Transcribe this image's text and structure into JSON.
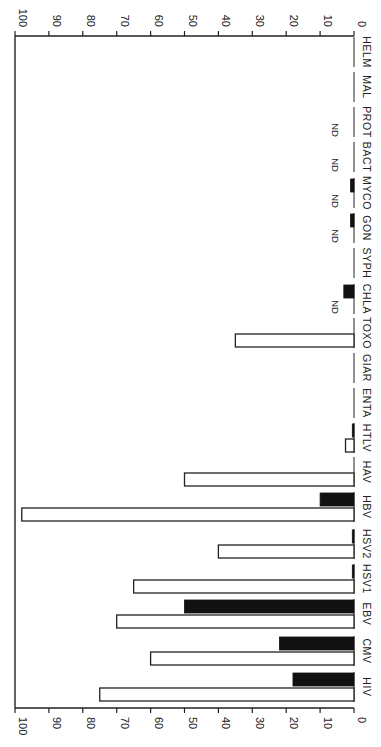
{
  "chart_data": {
    "type": "bar",
    "orientation": "rotated-90-clockwise (horizontal bars on page; page must be rotated to read)",
    "title": "",
    "xlabel": "",
    "ylabel": "",
    "ylim": [
      0,
      100
    ],
    "y_ticks": [
      0,
      10,
      20,
      30,
      40,
      50,
      60,
      70,
      80,
      90,
      100
    ],
    "grid": false,
    "legend": null,
    "categories": [
      "HIV",
      "CMV",
      "EBV",
      "HSV1",
      "HSV2",
      "HBV",
      "HAV",
      "HTLV",
      "ENTA",
      "GIAR",
      "TOXO",
      "CHLA",
      "SYPH",
      "GON",
      "MYCO",
      "BACT",
      "PROT",
      "MAL",
      "HELM"
    ],
    "series": [
      {
        "name": "open bars",
        "style": "white fill, black outline",
        "values": [
          75,
          60,
          70,
          65,
          40,
          98,
          50,
          2.5,
          0,
          0,
          35,
          null,
          0,
          null,
          null,
          null,
          null,
          0,
          0
        ]
      },
      {
        "name": "solid bars",
        "style": "black fill",
        "values": [
          18,
          22,
          50,
          0.5,
          0.5,
          10,
          0,
          0.5,
          0,
          0,
          0,
          3,
          0,
          1,
          1,
          0,
          0,
          0,
          0
        ]
      }
    ],
    "annotations": [
      {
        "category": "CHLA",
        "series": "open bars",
        "text": "ND"
      },
      {
        "category": "GON",
        "series": "open bars",
        "text": "ND"
      },
      {
        "category": "MYCO",
        "series": "open bars",
        "text": "ND"
      },
      {
        "category": "BACT",
        "series": "open bars",
        "text": "ND"
      },
      {
        "category": "PROT",
        "series": "open bars",
        "text": "ND"
      }
    ]
  },
  "layout": {
    "zero_x": 354,
    "hundred_x": 15,
    "top_axis_y": 36,
    "bottom_axis_y": 708,
    "category_centers_y": [
      687,
      651,
      614,
      579,
      544,
      507,
      472,
      438,
      403,
      368,
      333,
      299,
      263,
      228,
      193,
      157,
      122,
      87,
      52
    ],
    "bar_thickness": 13,
    "bar_gap": 1
  },
  "colors": {
    "ink": "#222222",
    "solid_fill": "#111111",
    "background": "#ffffff"
  }
}
